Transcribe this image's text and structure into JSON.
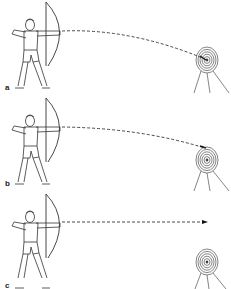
{
  "figure": {
    "panels": [
      {
        "label": "a",
        "arrow_path": "high-arc",
        "outcome": "hits target center"
      },
      {
        "label": "b",
        "arrow_path": "low-arc",
        "outcome": "hits target top edge"
      },
      {
        "label": "c",
        "arrow_path": "straight",
        "outcome": "flies over target"
      }
    ]
  },
  "colors": {
    "line": "#333333",
    "background": "#ffffff"
  }
}
